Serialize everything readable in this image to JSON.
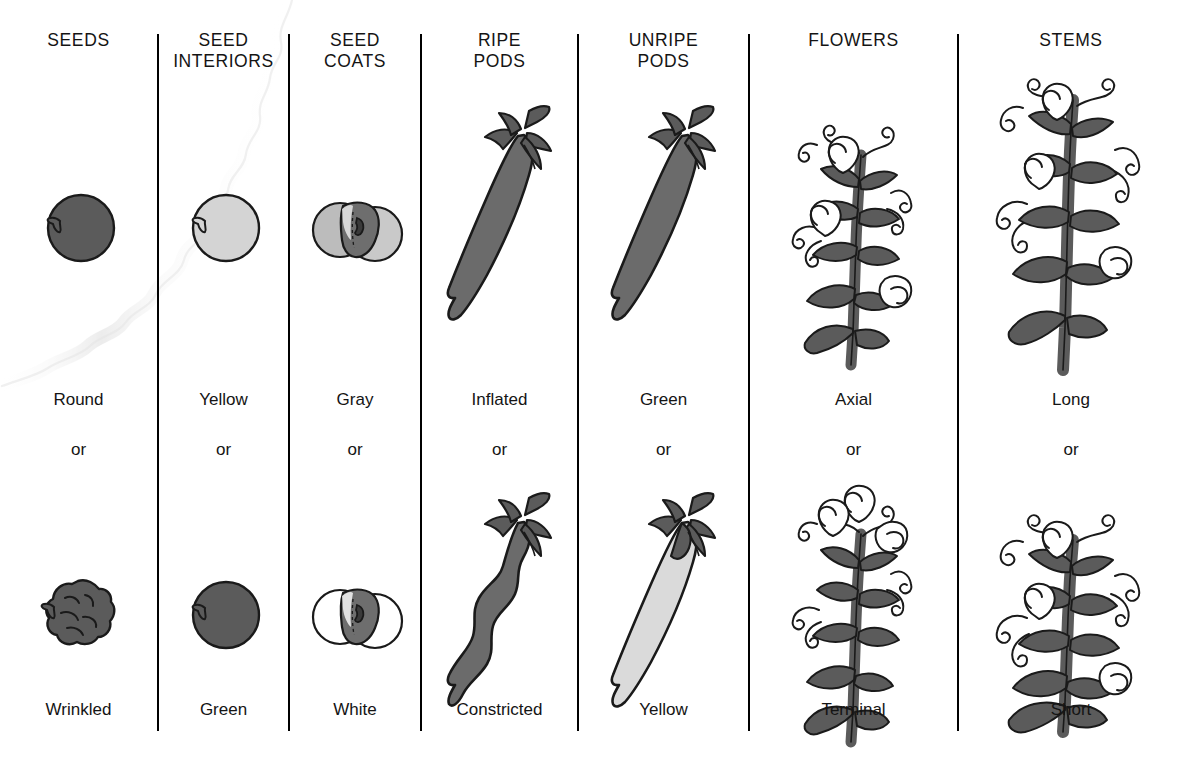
{
  "figure": {
    "background_color": "#ffffff",
    "line_color": "#000000",
    "text_color": "#141414",
    "artifact": "diagonal-crease-shadow-upper-left"
  },
  "palette": {
    "dark_gray": "#5b5b5b",
    "darker_gray": "#555555",
    "mid_gray": "#6e6e6e",
    "light_gray": "#d4d4d4",
    "pale_gray": "#d9d9d9",
    "white": "#ffffff",
    "outline": "#1a1a1a"
  },
  "columns": [
    {
      "header": "SEEDS",
      "dominant": {
        "label": "Round",
        "art": "round-seed",
        "fill": "dark_gray"
      },
      "connector": "or",
      "recessive": {
        "label": "Wrinkled",
        "art": "wrinkled-seed",
        "fill": "dark_gray"
      }
    },
    {
      "header": "SEED\nINTERIORS",
      "dominant": {
        "label": "Yellow",
        "art": "seed-interior-yellow",
        "fill": "light_gray"
      },
      "connector": "or",
      "recessive": {
        "label": "Green",
        "art": "seed-interior-green",
        "fill": "dark_gray"
      }
    },
    {
      "header": "SEED\nCOATS",
      "dominant": {
        "label": "Gray",
        "art": "seed-coat-gray",
        "fill": "light_gray"
      },
      "connector": "or",
      "recessive": {
        "label": "White",
        "art": "seed-coat-white",
        "fill": "white"
      }
    },
    {
      "header": "RIPE\nPODS",
      "dominant": {
        "label": "Inflated",
        "art": "inflated-pod",
        "fill": "dark_gray"
      },
      "connector": "or",
      "recessive": {
        "label": "Constricted",
        "art": "constricted-pod",
        "fill": "dark_gray"
      }
    },
    {
      "header": "UNRIPE\nPODS",
      "dominant": {
        "label": "Green",
        "art": "green-pod",
        "fill": "dark_gray"
      },
      "connector": "or",
      "recessive": {
        "label": "Yellow",
        "art": "yellow-pod",
        "fill": "light_gray"
      }
    },
    {
      "header": "FLOWERS",
      "dominant": {
        "label": "Axial",
        "art": "axial-flower-plant",
        "fill": "dark_gray"
      },
      "connector": "or",
      "recessive": {
        "label": "Terminal",
        "art": "terminal-flower-plant",
        "fill": "dark_gray"
      }
    },
    {
      "header": "STEMS",
      "dominant": {
        "label": "Long",
        "art": "long-stem-plant",
        "fill": "dark_gray"
      },
      "connector": "or",
      "recessive": {
        "label": "Short",
        "art": "short-stem-plant",
        "fill": "dark_gray"
      }
    }
  ],
  "divider_positions_px": [
    157,
    288,
    420,
    577,
    748,
    957
  ]
}
